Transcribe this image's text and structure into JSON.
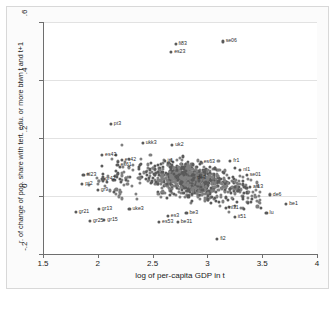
{
  "chart_data": {
    "type": "scatter",
    "title": "",
    "xlabel": "log of per-capita GDP in t",
    "ylabel": "r. of change of pop. share with tert. edu. or more btwn t and t+1",
    "xlim": [
      1.5,
      4.0
    ],
    "ylim": [
      -0.2,
      0.6
    ],
    "xticks": [
      "1.5",
      "2",
      "2.5",
      "3",
      "3.5",
      "4"
    ],
    "xtick_values": [
      1.5,
      2,
      2.5,
      3,
      3.5,
      4
    ],
    "yticks": [
      ".6",
      ".4",
      ".2",
      "0",
      "-.2"
    ],
    "ytick_values": [
      0.6,
      0.4,
      0.2,
      0,
      -0.2
    ],
    "grid": "horizontal",
    "legend": "none",
    "marker_color": "#7f7f7f",
    "axis_color": "#6e6e6e",
    "gridline_color": "#e2e2e2",
    "labeled_points": [
      {
        "label": "fi83",
        "x": 2.7,
        "y": 0.525
      },
      {
        "label": "es23",
        "x": 2.66,
        "y": 0.498
      },
      {
        "label": "se06",
        "x": 3.13,
        "y": 0.533
      },
      {
        "label": "pt3",
        "x": 2.11,
        "y": 0.248
      },
      {
        "label": "ukk3",
        "x": 2.4,
        "y": 0.183
      },
      {
        "label": "uk2",
        "x": 2.67,
        "y": 0.175
      },
      {
        "label": "es43",
        "x": 2.03,
        "y": 0.143
      },
      {
        "label": "es42",
        "x": 2.21,
        "y": 0.125
      },
      {
        "label": "es61",
        "x": 2.17,
        "y": 0.108
      },
      {
        "label": "nl23",
        "x": 1.86,
        "y": 0.073
      },
      {
        "label": "pt2",
        "x": 1.85,
        "y": 0.043
      },
      {
        "label": "gr42",
        "x": 2.03,
        "y": 0.058
      },
      {
        "label": "gr9",
        "x": 1.99,
        "y": 0.022
      },
      {
        "label": "gr13",
        "x": 2.0,
        "y": -0.045
      },
      {
        "label": "gr21",
        "x": 1.79,
        "y": -0.055
      },
      {
        "label": "gr25",
        "x": 1.92,
        "y": -0.087
      },
      {
        "label": "gr15",
        "x": 2.05,
        "y": -0.082
      },
      {
        "label": "uke3",
        "x": 2.28,
        "y": -0.045
      },
      {
        "label": "es53",
        "x": 2.55,
        "y": -0.09
      },
      {
        "label": "be31",
        "x": 2.72,
        "y": -0.09
      },
      {
        "label": "fi2",
        "x": 3.08,
        "y": -0.148
      },
      {
        "label": "nl1",
        "x": 3.29,
        "y": 0.09
      },
      {
        "label": "se01",
        "x": 3.35,
        "y": 0.073
      },
      {
        "label": "at13",
        "x": 3.38,
        "y": 0.03
      },
      {
        "label": "de6",
        "x": 3.56,
        "y": 0.005
      },
      {
        "label": "be1",
        "x": 3.71,
        "y": -0.028
      },
      {
        "label": "lu",
        "x": 3.53,
        "y": -0.058
      },
      {
        "label": "nl31",
        "x": 3.16,
        "y": -0.042
      },
      {
        "label": "es63",
        "x": 2.93,
        "y": 0.118
      },
      {
        "label": "de3",
        "x": 2.87,
        "y": 0.062
      },
      {
        "label": "it1",
        "x": 2.6,
        "y": 0.12
      },
      {
        "label": "fr1",
        "x": 3.2,
        "y": 0.12
      },
      {
        "label": "be3",
        "x": 2.8,
        "y": -0.06
      },
      {
        "label": "es3",
        "x": 2.63,
        "y": -0.068
      },
      {
        "label": "it51",
        "x": 3.24,
        "y": -0.072
      }
    ]
  },
  "axes": {
    "x_title": "log of per-capita GDP in t",
    "y_title": "r. of change of pop. share with tert. edu. or more btwn t and t+1"
  }
}
